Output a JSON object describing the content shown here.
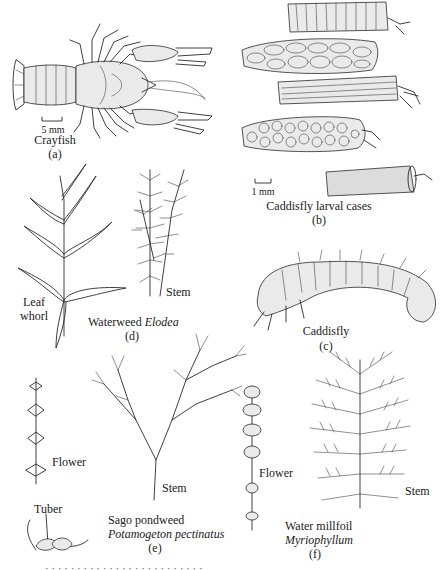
{
  "figure": {
    "panels": [
      {
        "id": "a",
        "label": "(a)",
        "title": "Crayfish",
        "scale_bar": "5 mm"
      },
      {
        "id": "b",
        "label": "(b)",
        "title": "Caddisfly larval cases",
        "scale_bar": "1 mm"
      },
      {
        "id": "c",
        "label": "(c)",
        "title": "Caddisfly"
      },
      {
        "id": "d",
        "label": "(d)",
        "title_common": "Waterweed",
        "title_genus": "Elodea",
        "annotations": [
          "Leaf whorl",
          "Stem"
        ]
      },
      {
        "id": "e",
        "label": "(e)",
        "title_common": "Sago pondweed",
        "title_species": "Potamogeton pectinatus",
        "annotations": [
          "Flower",
          "Stem",
          "Tuber"
        ]
      },
      {
        "id": "f",
        "label": "(f)",
        "title_common": "Water millfoil",
        "title_genus": "Myriophyllum",
        "annotations": [
          "Flower",
          "Stem"
        ]
      }
    ],
    "leaf_whorl_line1": "Leaf",
    "leaf_whorl_line2": "whorl",
    "caption_cutoff": "· · · · · · · · · · · · · · · · · · · · · · · · ·"
  }
}
